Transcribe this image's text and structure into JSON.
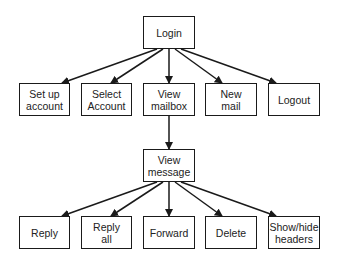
{
  "diagram": {
    "type": "tree",
    "title": "",
    "colors": {
      "stroke": "#1a1a1a",
      "text": "#222222",
      "background": "#ffffff"
    },
    "nodes": [
      {
        "id": "login",
        "label": "Login",
        "x": 143,
        "y": 16,
        "w": 52,
        "h": 33
      },
      {
        "id": "setup",
        "label": "Set up\naccount",
        "x": 19,
        "y": 83,
        "w": 51,
        "h": 33
      },
      {
        "id": "select",
        "label": "Select\nAccount",
        "x": 81,
        "y": 83,
        "w": 51,
        "h": 33
      },
      {
        "id": "mailbox",
        "label": "View\nmailbox",
        "x": 143,
        "y": 83,
        "w": 52,
        "h": 33
      },
      {
        "id": "newmail",
        "label": "New\nmail",
        "x": 205,
        "y": 83,
        "w": 52,
        "h": 33
      },
      {
        "id": "logout",
        "label": "Logout",
        "x": 268,
        "y": 83,
        "w": 52,
        "h": 33
      },
      {
        "id": "message",
        "label": "View\nmessage",
        "x": 143,
        "y": 149,
        "w": 52,
        "h": 33
      },
      {
        "id": "reply",
        "label": "Reply",
        "x": 19,
        "y": 216,
        "w": 51,
        "h": 33
      },
      {
        "id": "replyall",
        "label": "Reply\nall",
        "x": 81,
        "y": 216,
        "w": 51,
        "h": 33
      },
      {
        "id": "forward",
        "label": "Forward",
        "x": 143,
        "y": 216,
        "w": 52,
        "h": 33
      },
      {
        "id": "delete",
        "label": "Delete",
        "x": 205,
        "y": 216,
        "w": 52,
        "h": 33
      },
      {
        "id": "showhide",
        "label": "Show/hide\nheaders",
        "x": 268,
        "y": 216,
        "w": 52,
        "h": 33
      }
    ],
    "edges": [
      {
        "from": "login",
        "to": "setup",
        "x1": 157,
        "y1": 49,
        "x2": 62,
        "y2": 83
      },
      {
        "from": "login",
        "to": "select",
        "x1": 163,
        "y1": 49,
        "x2": 111,
        "y2": 83
      },
      {
        "from": "login",
        "to": "mailbox",
        "x1": 169,
        "y1": 49,
        "x2": 169,
        "y2": 83
      },
      {
        "from": "login",
        "to": "newmail",
        "x1": 175,
        "y1": 49,
        "x2": 222,
        "y2": 83
      },
      {
        "from": "login",
        "to": "logout",
        "x1": 181,
        "y1": 49,
        "x2": 276,
        "y2": 83
      },
      {
        "from": "mailbox",
        "to": "message",
        "x1": 169,
        "y1": 116,
        "x2": 169,
        "y2": 149
      },
      {
        "from": "message",
        "to": "reply",
        "x1": 157,
        "y1": 182,
        "x2": 62,
        "y2": 216
      },
      {
        "from": "message",
        "to": "replyall",
        "x1": 163,
        "y1": 182,
        "x2": 111,
        "y2": 216
      },
      {
        "from": "message",
        "to": "forward",
        "x1": 169,
        "y1": 182,
        "x2": 169,
        "y2": 216
      },
      {
        "from": "message",
        "to": "delete",
        "x1": 175,
        "y1": 182,
        "x2": 222,
        "y2": 216
      },
      {
        "from": "message",
        "to": "showhide",
        "x1": 181,
        "y1": 182,
        "x2": 276,
        "y2": 216
      }
    ]
  }
}
